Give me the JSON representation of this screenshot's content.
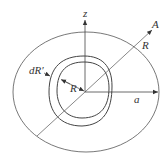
{
  "diagram": {
    "labels": {
      "z_axis": "z",
      "point_A": "A",
      "radius_R_outer": "R",
      "radius_a": "a",
      "shell_thickness": "dR′",
      "radius_R_inner": "R"
    },
    "colors": {
      "stroke": "#444444",
      "text": "#333333",
      "background": "#ffffff"
    }
  }
}
